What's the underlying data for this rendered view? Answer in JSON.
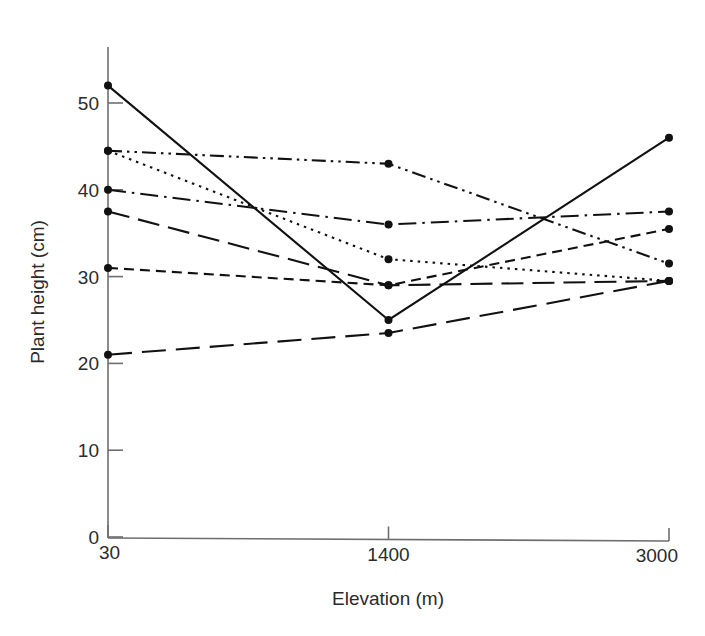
{
  "chart_data": {
    "type": "line",
    "title": "",
    "xlabel": "Elevation (m)",
    "ylabel": "Plant height (cm)",
    "categories": [
      "30",
      "1400",
      "3000"
    ],
    "x": [
      30,
      1400,
      3000
    ],
    "xtick_labels": [
      "30",
      "1400",
      "3000"
    ],
    "ytick_labels": [
      "0",
      "10",
      "20",
      "30",
      "40",
      "50"
    ],
    "yticks": [
      0,
      10,
      20,
      30,
      40,
      50
    ],
    "ylim": [
      0,
      55
    ],
    "grid": false,
    "legend": "none",
    "markers": "filled-circle",
    "series": [
      {
        "name": "series-1",
        "line_style": "solid",
        "dasharray": "none",
        "values": [
          52.0,
          25.0,
          46.0
        ]
      },
      {
        "name": "series-2",
        "line_style": "dash-dot-dot",
        "dasharray": "14,5,2.5,5,2.5,5",
        "values": [
          44.5,
          43.0,
          31.5
        ]
      },
      {
        "name": "series-3",
        "line_style": "dash-dot",
        "dasharray": "18,6,2.5,6",
        "values": [
          40.0,
          36.0,
          37.5
        ]
      },
      {
        "name": "series-4",
        "line_style": "dotted",
        "dasharray": "2.5,5",
        "values": [
          44.5,
          32.0,
          29.5
        ]
      },
      {
        "name": "series-5",
        "line_style": "long-dash",
        "dasharray": "22,9",
        "values": [
          37.5,
          29.0,
          29.5
        ]
      },
      {
        "name": "series-6",
        "line_style": "short-dash",
        "dasharray": "10,6",
        "values": [
          31.0,
          29.0,
          35.5
        ]
      },
      {
        "name": "series-7",
        "line_style": "long-dash",
        "dasharray": "24,10",
        "values": [
          21.0,
          23.5,
          29.5
        ]
      }
    ]
  },
  "axes": {
    "x_title": "Elevation (m)",
    "y_title": "Plant height (cm)",
    "x_ticks": [
      "30",
      "1400",
      "3000"
    ],
    "y_ticks": [
      "50",
      "40",
      "30",
      "20",
      "10",
      "0"
    ]
  },
  "style": {
    "line_color": "#111111",
    "axis_color": "#6e6e6e",
    "text_color": "#2b2b2b",
    "background": "#ffffff"
  }
}
